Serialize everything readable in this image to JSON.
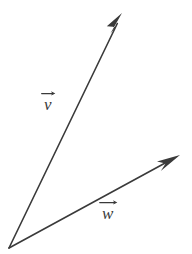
{
  "figure": {
    "background_color": "#ffffff",
    "stroke_color": "#3a3a3a",
    "stroke_width": 1.6,
    "width": 192,
    "height": 254
  },
  "origin": {
    "label": "origin",
    "x": 9,
    "y": 248
  },
  "vectors": [
    {
      "id": "v",
      "label": "v",
      "label_full": "⃗v",
      "has_overset_arrow": true,
      "tail_x": 9,
      "tail_y": 248,
      "tip_x": 122,
      "tip_y": 13,
      "label_x": 52,
      "label_y": 106,
      "arrowhead": "slim-triangle",
      "color": "#3a3a3a"
    },
    {
      "id": "w",
      "label": "w",
      "label_full": "⃗w",
      "has_overset_arrow": true,
      "tail_x": 9,
      "tail_y": 248,
      "tip_x": 180,
      "tip_y": 155,
      "label_x": 113,
      "label_y": 215,
      "arrowhead": "slim-triangle",
      "color": "#3a3a3a"
    }
  ]
}
